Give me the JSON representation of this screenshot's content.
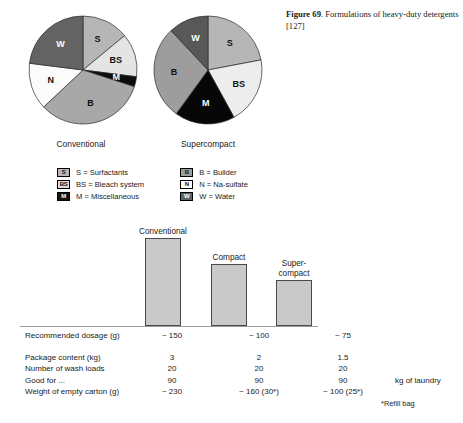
{
  "figure": {
    "number": "Figure 69",
    "separator": ".",
    "caption": " Formulations of heavy-duty detergents [127]"
  },
  "chart_data": [
    {
      "type": "pie",
      "title": "Conventional",
      "categories": [
        "S",
        "BS",
        "M",
        "B",
        "N",
        "W"
      ],
      "labels": [
        "S",
        "BS",
        "M",
        "B",
        "N",
        "W"
      ],
      "values": [
        14,
        13,
        3,
        33,
        14,
        23
      ],
      "colors": [
        "#b6b6b6",
        "#e4e4e4",
        "#0d0d0d",
        "#a8a8a8",
        "#fbfbfb",
        "#636363"
      ],
      "label_colors": [
        "on-light",
        "on-light",
        "on-dark",
        "on-light",
        "on-light",
        "on-dark"
      ],
      "start_angle": 0,
      "legend_position": "below"
    },
    {
      "type": "pie",
      "title": "Supercompact",
      "categories": [
        "S",
        "BS",
        "M",
        "B",
        "W"
      ],
      "labels": [
        "S",
        "BS",
        "M",
        "B",
        "W"
      ],
      "values": [
        22,
        20,
        18,
        28,
        12
      ],
      "colors": [
        "#b6b6b6",
        "#ededed",
        "#070707",
        "#9d9d9d",
        "#585858"
      ],
      "label_colors": [
        "on-light",
        "on-light",
        "on-dark",
        "on-light",
        "on-dark"
      ],
      "start_angle": 0,
      "legend_position": "below"
    },
    {
      "type": "bar",
      "title": "",
      "categories": [
        "Conventional",
        "Compact",
        "Super-\ncompact"
      ],
      "values": [
        150,
        100,
        75
      ],
      "value_labels": [
        "~ 150",
        "~ 100",
        "~ 75"
      ],
      "xlabel": "",
      "ylabel": "Recommended dosage (g)",
      "ylim": [
        0,
        160
      ],
      "grid": false,
      "bar_color": "#c9c9c9",
      "bar_border": "#4a4a4a"
    }
  ],
  "legend": {
    "items": [
      {
        "key": "S",
        "text": "S = Surfactants",
        "swatch_fill": "#b6b6b6",
        "swatch_text": "#111111",
        "label": "S"
      },
      {
        "key": "B",
        "text": "B = Builder",
        "swatch_fill": "#9d9d9d",
        "swatch_text": "#111111",
        "label": "B"
      },
      {
        "key": "BS",
        "text": "BS = Bleach system",
        "swatch_fill": "#dcdcdc",
        "swatch_text": "#111111",
        "label": "BS"
      },
      {
        "key": "N",
        "text": "N = Na-sulfate",
        "swatch_fill": "#ffffff",
        "swatch_text": "#111111",
        "label": "N"
      },
      {
        "key": "M",
        "text": "M = Miscellaneous",
        "swatch_fill": "#151515",
        "swatch_text": "#ffffff",
        "label": "M"
      },
      {
        "key": "W",
        "text": "W = Water",
        "swatch_fill": "#636363",
        "swatch_text": "#ffffff",
        "label": "W"
      }
    ]
  },
  "bars": {
    "items": [
      {
        "label": "Conventional",
        "label_line1": "Conventional",
        "label_line2": "",
        "height_px": 88,
        "left_px": 125,
        "width_px": 36
      },
      {
        "label": "Compact",
        "label_line1": "Compact",
        "label_line2": "",
        "height_px": 62,
        "left_px": 191,
        "width_px": 36
      },
      {
        "label": "Super-compact",
        "label_line1": "Super-",
        "label_line2": "compact",
        "height_px": 46,
        "left_px": 256,
        "width_px": 36
      }
    ]
  },
  "table": {
    "dosage_row": {
      "label": "Recommended dosage (g)",
      "values": [
        "~ 150",
        "~ 100",
        "~ 75"
      ]
    },
    "rows": [
      {
        "label": "Package content (kg)",
        "values": [
          "3",
          "2",
          "1.5"
        ],
        "unit": ""
      },
      {
        "label": "Number of wash loads",
        "values": [
          "20",
          "20",
          "20"
        ],
        "unit": ""
      },
      {
        "label": "Good for ...",
        "values": [
          "90",
          "90",
          "90"
        ],
        "unit": "kg of laundry"
      },
      {
        "label": "Weight of empty carton (g)",
        "values": [
          "~ 230",
          "~ 160 (30*)",
          "~ 100 (25*)"
        ],
        "unit": ""
      }
    ],
    "footnote": "*Refill bag"
  }
}
